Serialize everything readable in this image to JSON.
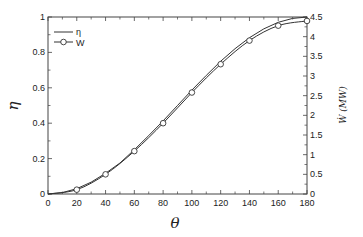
{
  "chart_data": {
    "type": "line",
    "title": "",
    "xlabel": "θ",
    "ylabel": "η",
    "ylabel_right": "Ẇ (MW)",
    "xlim": [
      0,
      180
    ],
    "ylim": [
      0,
      1
    ],
    "ylim_right": [
      0,
      4.5
    ],
    "x_ticks": [
      0,
      20,
      40,
      60,
      80,
      100,
      120,
      140,
      160,
      180
    ],
    "y_ticks": [
      0,
      0.2,
      0.4,
      0.6,
      0.8,
      1
    ],
    "y_ticks_right": [
      0,
      0.5,
      1,
      1.5,
      2,
      2.5,
      3,
      3.5,
      4,
      4.5
    ],
    "grid": false,
    "legend_position": "upper-left",
    "series": [
      {
        "name": "η",
        "axis": "left",
        "marker": "none",
        "x": [
          0,
          10,
          20,
          30,
          40,
          50,
          60,
          70,
          80,
          90,
          100,
          110,
          120,
          130,
          140,
          150,
          160,
          170,
          180
        ],
        "values": [
          0,
          0.008,
          0.03,
          0.067,
          0.117,
          0.175,
          0.25,
          0.33,
          0.413,
          0.5,
          0.587,
          0.67,
          0.75,
          0.821,
          0.883,
          0.933,
          0.97,
          0.992,
          1.0
        ]
      },
      {
        "name": "W",
        "axis": "right",
        "marker": "circle",
        "x": [
          0,
          20,
          40,
          60,
          80,
          100,
          120,
          140,
          160,
          180
        ],
        "values": [
          0,
          0.11,
          0.5,
          1.09,
          1.8,
          2.58,
          3.3,
          3.9,
          4.28,
          4.4
        ]
      }
    ]
  },
  "legend": {
    "items": [
      {
        "label": "η",
        "style": "line"
      },
      {
        "label": "W",
        "style": "line-circle"
      }
    ]
  },
  "axes": {
    "xlabel": "θ",
    "ylabel": "η",
    "ylabel_right": "Ẇ (MW)"
  }
}
